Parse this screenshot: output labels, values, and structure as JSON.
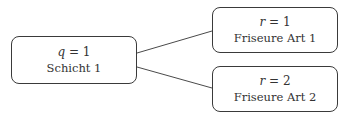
{
  "nodes": {
    "root": {
      "var": "q",
      "eq": " = 1",
      "label": "Schicht 1"
    },
    "child1": {
      "var": "r",
      "eq": " = 1",
      "label": "Friseure Art 1"
    },
    "child2": {
      "var": "r",
      "eq": " = 2",
      "label": "Friseure Art 2"
    }
  },
  "colors": {
    "stroke": "#3a3a3a",
    "text": "#333333",
    "background": "#ffffff"
  }
}
